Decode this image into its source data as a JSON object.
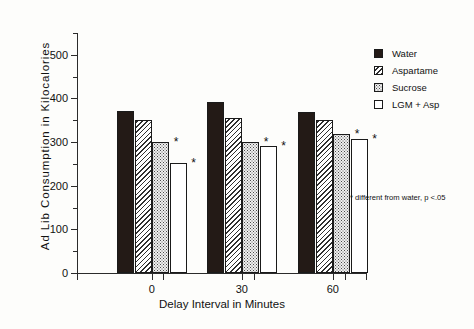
{
  "chart_data": {
    "type": "bar",
    "title": "",
    "xlabel": "Delay Interval in Minutes",
    "ylabel": "Ad Lib Consumption  in  Kilocalories",
    "categories": [
      "0",
      "30",
      "60"
    ],
    "ylim": [
      0,
      550
    ],
    "yticks": [
      0,
      100,
      200,
      300,
      400,
      500
    ],
    "ytick_labels": [
      "0",
      "100",
      "200",
      "300",
      "400",
      "500"
    ],
    "yminor_ticks": [
      50,
      150,
      250,
      350,
      450,
      550
    ],
    "grid": false,
    "legend_position": "right",
    "series": [
      {
        "name": "Water",
        "fill": "solid",
        "values": [
          372,
          393,
          370
        ],
        "significant": [
          false,
          false,
          false
        ]
      },
      {
        "name": "Aspartame",
        "fill": "hatch",
        "values": [
          351,
          355,
          350
        ],
        "significant": [
          false,
          false,
          false
        ]
      },
      {
        "name": "Sucrose",
        "fill": "dots",
        "values": [
          300,
          300,
          318
        ],
        "significant": [
          true,
          true,
          true
        ]
      },
      {
        "name": "LGM + Asp",
        "fill": "open",
        "values": [
          251,
          290,
          306
        ],
        "significant": [
          true,
          true,
          true
        ]
      }
    ],
    "annotations": {
      "footnote": "* different from water, p <.05",
      "significance_marker": "*"
    }
  }
}
